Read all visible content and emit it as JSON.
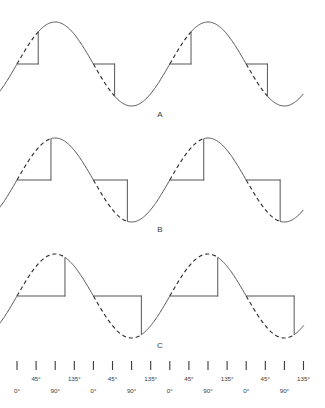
{
  "figure": {
    "title": "",
    "background_color": "#ffffff",
    "solid_color": "#555555",
    "dashed_color": "#2e2e2e",
    "width": 325,
    "height": 408
  },
  "waveforms": [
    {
      "label": "A",
      "label_x": 160,
      "label_y": 117,
      "baseline_y": 64,
      "amplitude": 42,
      "firing_angle_deg": 50,
      "description": "phase-controlled sine with small firing delay"
    },
    {
      "label": "B",
      "label_x": 160,
      "label_y": 232,
      "baseline_y": 180,
      "amplitude": 42,
      "firing_angle_deg": 80,
      "description": "phase-controlled sine fired near the peak"
    },
    {
      "label": "C",
      "label_x": 160,
      "label_y": 348,
      "baseline_y": 296,
      "amplitude": 42,
      "firing_angle_deg": 113,
      "description": "phase-controlled sine fired after the peak"
    }
  ],
  "axis": {
    "tick_y_top": 361,
    "tick_y_bottom": 370,
    "first_tick_x": 17,
    "tick_spacing": 19.1,
    "tick_count": 16,
    "upper_row_y": 381,
    "lower_row_y": 393,
    "labels": [
      {
        "text": "0°",
        "row": "lower"
      },
      {
        "text": "45°",
        "row": "upper"
      },
      {
        "text": "90°",
        "row": "lower"
      },
      {
        "text": "135°",
        "row": "upper"
      },
      {
        "text": "0°",
        "row": "lower"
      },
      {
        "text": "45°",
        "row": "upper"
      },
      {
        "text": "90°",
        "row": "lower"
      },
      {
        "text": "135°",
        "row": "upper"
      },
      {
        "text": "0°",
        "row": "lower"
      },
      {
        "text": "45°",
        "row": "upper"
      },
      {
        "text": "90°",
        "row": "lower"
      },
      {
        "text": "135°",
        "row": "upper"
      },
      {
        "text": "0°",
        "row": "lower"
      },
      {
        "text": "45°",
        "row": "upper"
      },
      {
        "text": "90°",
        "row": "lower"
      },
      {
        "text": "135°",
        "row": "upper"
      }
    ]
  },
  "chart_data": {
    "type": "line",
    "title": "",
    "xlabel": "",
    "ylabel": "",
    "x_unit": "degrees",
    "x_range_deg": [
      -45,
      675
    ],
    "series": [
      {
        "name": "A",
        "firing_angle_deg": 50,
        "conducting": "solid sine from firing angle to end of half cycle",
        "blocked": "dashed sine from start of half cycle to firing angle, output held at zero"
      },
      {
        "name": "B",
        "firing_angle_deg": 80,
        "conducting": "solid sine from firing angle to end of half cycle",
        "blocked": "dashed sine from start of half cycle to firing angle, output held at zero"
      },
      {
        "name": "C",
        "firing_angle_deg": 113,
        "conducting": "solid sine from firing angle to end of half cycle",
        "blocked": "dashed sine from start of half cycle to firing angle, output held at zero"
      }
    ]
  }
}
